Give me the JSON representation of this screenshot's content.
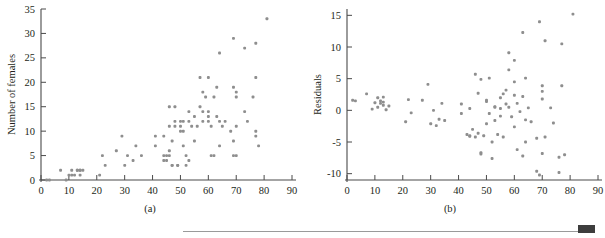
{
  "figure": {
    "panel_a_caption": "(a)",
    "panel_b_caption": "(b)"
  },
  "chart_data": [
    {
      "id": "panel-a",
      "type": "scatter",
      "title": "",
      "xlabel": "Number of males",
      "ylabel": "Number of females",
      "xlim": [
        0,
        90
      ],
      "ylim": [
        0,
        35
      ],
      "xticks": [
        0,
        10,
        20,
        30,
        40,
        50,
        60,
        70,
        80,
        90
      ],
      "yticks": [
        0,
        5,
        10,
        15,
        20,
        25,
        30,
        35
      ],
      "grid": false,
      "legend": "none",
      "marker_color": "#8e8e8e",
      "points": [
        [
          2,
          0
        ],
        [
          3,
          0
        ],
        [
          7,
          2
        ],
        [
          9,
          0
        ],
        [
          10,
          1
        ],
        [
          11,
          2
        ],
        [
          11,
          1
        ],
        [
          12,
          1
        ],
        [
          13,
          2
        ],
        [
          13,
          2
        ],
        [
          14,
          2
        ],
        [
          14,
          1
        ],
        [
          14,
          2
        ],
        [
          15,
          2
        ],
        [
          21,
          1
        ],
        [
          22,
          5
        ],
        [
          23,
          3
        ],
        [
          27,
          6
        ],
        [
          29,
          9
        ],
        [
          30,
          3
        ],
        [
          31,
          5
        ],
        [
          33,
          4
        ],
        [
          34,
          7
        ],
        [
          36,
          5
        ],
        [
          41,
          7
        ],
        [
          41,
          9
        ],
        [
          44,
          9
        ],
        [
          44,
          4
        ],
        [
          44,
          5
        ],
        [
          45,
          5
        ],
        [
          45,
          4
        ],
        [
          46,
          15
        ],
        [
          46,
          11
        ],
        [
          46,
          5
        ],
        [
          46,
          6
        ],
        [
          47,
          8
        ],
        [
          47,
          3
        ],
        [
          47,
          3
        ],
        [
          48,
          15
        ],
        [
          48,
          12
        ],
        [
          48,
          11
        ],
        [
          49,
          3
        ],
        [
          49,
          3
        ],
        [
          50,
          10
        ],
        [
          50,
          12
        ],
        [
          50,
          11
        ],
        [
          51,
          12
        ],
        [
          51,
          10
        ],
        [
          51,
          7
        ],
        [
          52,
          5
        ],
        [
          52,
          3
        ],
        [
          53,
          12
        ],
        [
          53,
          4
        ],
        [
          53,
          14
        ],
        [
          54,
          11
        ],
        [
          55,
          13
        ],
        [
          55,
          8
        ],
        [
          56,
          11
        ],
        [
          57,
          21
        ],
        [
          57,
          15
        ],
        [
          58,
          14
        ],
        [
          58,
          18
        ],
        [
          58,
          12
        ],
        [
          59,
          17
        ],
        [
          60,
          21
        ],
        [
          60,
          13
        ],
        [
          60,
          14
        ],
        [
          60,
          12
        ],
        [
          61,
          11
        ],
        [
          61,
          5
        ],
        [
          62,
          17
        ],
        [
          62,
          5
        ],
        [
          63,
          19
        ],
        [
          63,
          13
        ],
        [
          64,
          26
        ],
        [
          64,
          12
        ],
        [
          64,
          7
        ],
        [
          65,
          11
        ],
        [
          66,
          12
        ],
        [
          68,
          10
        ],
        [
          69,
          29
        ],
        [
          69,
          5
        ],
        [
          69,
          19
        ],
        [
          69,
          8
        ],
        [
          70,
          5
        ],
        [
          70,
          18
        ],
        [
          70,
          17
        ],
        [
          70,
          11
        ],
        [
          73,
          27
        ],
        [
          73,
          14
        ],
        [
          74,
          12
        ],
        [
          76,
          17
        ],
        [
          77,
          28
        ],
        [
          77,
          21
        ],
        [
          77,
          9
        ],
        [
          77,
          10
        ],
        [
          78,
          7
        ],
        [
          81,
          33
        ]
      ]
    },
    {
      "id": "panel-b",
      "type": "scatter",
      "title": "",
      "xlabel": "Number of males",
      "ylabel": "Residuals",
      "xlim": [
        0,
        90
      ],
      "ylim": [
        -11,
        16
      ],
      "xticks": [
        0,
        10,
        20,
        30,
        40,
        50,
        60,
        70,
        80,
        90
      ],
      "yticks": [
        -10,
        -5,
        0,
        5,
        10,
        15
      ],
      "grid": false,
      "legend": "none",
      "marker_color": "#8e8e8e",
      "points": [
        [
          2,
          1.6
        ],
        [
          3,
          1.5
        ],
        [
          7,
          2.6
        ],
        [
          9,
          0.2
        ],
        [
          10,
          1.2
        ],
        [
          11,
          2.0
        ],
        [
          11,
          0.5
        ],
        [
          12,
          1.5
        ],
        [
          12,
          1.1
        ],
        [
          13,
          2.1
        ],
        [
          13,
          0.8
        ],
        [
          13,
          1.3
        ],
        [
          14,
          0.1
        ],
        [
          15,
          0.7
        ],
        [
          21,
          -1.8
        ],
        [
          22,
          1.7
        ],
        [
          23,
          -0.4
        ],
        [
          27,
          1.6
        ],
        [
          29,
          4.1
        ],
        [
          30,
          -2.1
        ],
        [
          31,
          0.0
        ],
        [
          32,
          -2.4
        ],
        [
          33,
          -1.4
        ],
        [
          34,
          1.1
        ],
        [
          35,
          -1.6
        ],
        [
          41,
          1.0
        ],
        [
          41,
          -0.5
        ],
        [
          43,
          -3.8
        ],
        [
          44,
          -4.0
        ],
        [
          44,
          -4.1
        ],
        [
          44,
          0.3
        ],
        [
          45,
          -3.0
        ],
        [
          46,
          5.7
        ],
        [
          46,
          -4.2
        ],
        [
          47,
          2.7
        ],
        [
          47,
          -3.6
        ],
        [
          48,
          4.9
        ],
        [
          48,
          -6.7
        ],
        [
          48,
          -6.9
        ],
        [
          49,
          -4.0
        ],
        [
          50,
          1.4
        ],
        [
          50,
          1.6
        ],
        [
          50,
          -2.1
        ],
        [
          51,
          5.1
        ],
        [
          51,
          -0.5
        ],
        [
          52,
          -7.6
        ],
        [
          52,
          -5.0
        ],
        [
          53,
          0.5
        ],
        [
          53,
          0.6
        ],
        [
          53,
          -1.6
        ],
        [
          54,
          -3.8
        ],
        [
          55,
          2.0
        ],
        [
          55,
          0.3
        ],
        [
          55,
          -0.9
        ],
        [
          56,
          2.6
        ],
        [
          56,
          -4.2
        ],
        [
          57,
          3.2
        ],
        [
          57,
          1.0
        ],
        [
          58,
          9.1
        ],
        [
          58,
          6.4
        ],
        [
          58,
          0.5
        ],
        [
          59,
          -1.0
        ],
        [
          60,
          7.9
        ],
        [
          60,
          4.5
        ],
        [
          60,
          2.4
        ],
        [
          60,
          -2.6
        ],
        [
          61,
          1.1
        ],
        [
          61,
          -6.2
        ],
        [
          62,
          -0.2
        ],
        [
          63,
          12.3
        ],
        [
          63,
          2.2
        ],
        [
          63,
          -7.2
        ],
        [
          64,
          5.1
        ],
        [
          64,
          -1.5
        ],
        [
          64,
          -5.0
        ],
        [
          65,
          0.4
        ],
        [
          66,
          -1.8
        ],
        [
          68,
          -4.4
        ],
        [
          68,
          -9.6
        ],
        [
          69,
          14.0
        ],
        [
          69,
          -10.2
        ],
        [
          70,
          3.9
        ],
        [
          70,
          1.8
        ],
        [
          70,
          3.0
        ],
        [
          70,
          -6.8
        ],
        [
          71,
          11.0
        ],
        [
          71,
          -4.2
        ],
        [
          73,
          0.4
        ],
        [
          74,
          -2.0
        ],
        [
          76,
          -7.4
        ],
        [
          76,
          -9.8
        ],
        [
          77,
          3.9
        ],
        [
          77,
          10.5
        ],
        [
          78,
          -7.0
        ],
        [
          81,
          15.2
        ]
      ]
    }
  ]
}
